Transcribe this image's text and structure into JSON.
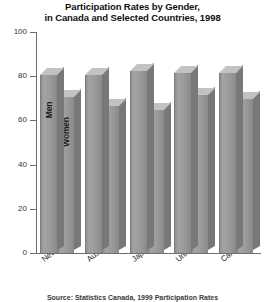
{
  "chart_data": {
    "type": "bar",
    "title": "Participation Rates by Gender, in Canada and Selected Countries, 1998",
    "title_lines": [
      "Participation Rates by Gender,",
      "in Canada and Selected Countries, 1998"
    ],
    "xlabel": "",
    "ylabel": "",
    "ylim": [
      0,
      100
    ],
    "yticks": [
      0,
      20,
      40,
      60,
      80,
      100
    ],
    "ytick_labels": [
      "0",
      "20",
      "40",
      "60",
      "80",
      "100"
    ],
    "grid": false,
    "legend_position": "in-bars",
    "categories": [
      "New Zealand",
      "Australia",
      "Japan",
      "United States",
      "Canada"
    ],
    "series": [
      {
        "name": "Men",
        "values": [
          81,
          81,
          83,
          82,
          82
        ]
      },
      {
        "name": "Women",
        "values": [
          71,
          67,
          65,
          72,
          70
        ]
      }
    ],
    "series_labels_inline": [
      "Men",
      "Women"
    ],
    "inline_label_group_index": 0,
    "colors": {
      "bar_face": "#9b9b9b",
      "bar_side": "#787878",
      "bar_top": "#c2c2c2",
      "axis": "#6d6d6d",
      "text": "#1a1a1a",
      "background": "#ffffff"
    }
  },
  "source": {
    "text": "Source: Statistics Canada, 1999 Participation Rates"
  }
}
